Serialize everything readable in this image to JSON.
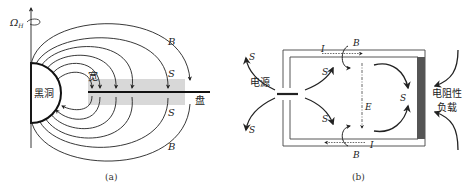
{
  "panel_a": {
    "caption": "(a)",
    "axis_label": "Ω",
    "axis_subscript": "H",
    "black_hole_label": "黑洞",
    "disc_label": "盘",
    "gap_label": "宽",
    "field_labels": [
      "B",
      "S",
      "S",
      "B"
    ],
    "colors": {
      "line": "#222222",
      "band": "#d8d8d8"
    }
  },
  "panel_b": {
    "caption": "(b)",
    "source_label": "电源",
    "load_label_line1": "电阻性",
    "load_label_line2": "负载",
    "current_label_top": "I",
    "current_label_bottom": "I",
    "field_label_top": "B",
    "field_label_bottom": "B",
    "efield_label": "E",
    "poynting_labels": [
      "S",
      "S",
      "S",
      "S",
      "S"
    ],
    "colors": {
      "line": "#333333",
      "load": "#555555"
    }
  }
}
